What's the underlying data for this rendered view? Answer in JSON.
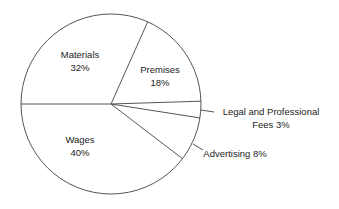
{
  "chart_data": {
    "type": "pie",
    "title": "",
    "start_angle_deg": 180,
    "direction": "clockwise",
    "slices": [
      {
        "label": "Materials",
        "value": 32,
        "text_lines": [
          "Materials",
          "32%"
        ],
        "label_pos": [
          80,
          58
        ],
        "inside": true
      },
      {
        "label": "Premises",
        "value": 18,
        "text_lines": [
          "Premises",
          "18%"
        ],
        "label_pos": [
          160,
          73
        ],
        "inside": true
      },
      {
        "label": "Legal and Professional Fees",
        "value": 3,
        "text_lines": [
          "Legal and Professional",
          "Fees 3%"
        ],
        "label_pos": [
          271,
          115
        ],
        "inside": false,
        "leader": [
          [
            201,
            110
          ],
          [
            214,
            112
          ]
        ]
      },
      {
        "label": "Advertising",
        "value": 8,
        "text_lines": [
          "Advertising 8%"
        ],
        "label_pos": [
          235,
          157
        ],
        "inside": false,
        "leader": [
          [
            193,
            144
          ],
          [
            203,
            150
          ]
        ]
      },
      {
        "label": "Wages",
        "value": 40,
        "text_lines": [
          "Wages",
          "40%"
        ],
        "label_pos": [
          80,
          143
        ],
        "inside": true
      }
    ],
    "values": [
      32,
      18,
      3,
      8,
      40
    ],
    "categories": [
      "Materials",
      "Premises",
      "Legal and Professional Fees",
      "Advertising",
      "Wages"
    ],
    "unit": "%",
    "legend": "none",
    "colors": {
      "fill": "#ffffff",
      "stroke": "#555555",
      "text": "#222222"
    }
  },
  "geometry": {
    "cx": 111,
    "cy": 104,
    "r": 90
  }
}
